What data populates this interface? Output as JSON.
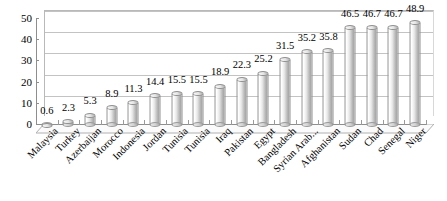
{
  "chart_data": {
    "type": "bar",
    "title": "",
    "subtitle": "",
    "xlabel": "",
    "ylabel": "",
    "ylim": [
      0,
      50
    ],
    "yticks": [
      0,
      10,
      20,
      30,
      40,
      50
    ],
    "grid": true,
    "legend": "none",
    "style": "3d-cylinder",
    "data_labels": true,
    "categories": [
      "Malaysia",
      "Turkey",
      "Azerbaijan",
      "Morocco",
      "Indonesia",
      "Jordan",
      "Tunisia",
      "Tunisia",
      "Iraq",
      "Pakistan",
      "Egypt",
      "Bangladesh",
      "Syrian Arab...",
      "Afghanistan",
      "Sudan",
      "Chad",
      "Senegal",
      "Niger"
    ],
    "values": [
      0.6,
      2.3,
      5.3,
      8.9,
      11.3,
      14.4,
      15.5,
      15.5,
      18.9,
      22.3,
      25.2,
      31.5,
      35.2,
      35.8,
      46.5,
      46.7,
      46.7,
      48.9
    ],
    "value_labels": [
      "0.6",
      "2.3",
      "5.3",
      "8.9",
      "11.3",
      "14.4",
      "15.5",
      "15.5",
      "18.9",
      "22.3",
      "25.2",
      "31.5",
      "35.2",
      "35.8",
      "46.5",
      "46.7",
      "46.7",
      "48.9"
    ],
    "ytick_labels": [
      "0",
      "10",
      "20",
      "30",
      "40",
      "50"
    ],
    "colors": {
      "bar_light": "#f3f3f3",
      "bar_mid": "#cfcfcf",
      "bar_dark": "#a8a8a8",
      "bar_outline": "#8f8f8f",
      "gridline": "#c3c3c3",
      "axis": "#8e8e8e",
      "text": "#000000",
      "background": "#ffffff"
    }
  }
}
